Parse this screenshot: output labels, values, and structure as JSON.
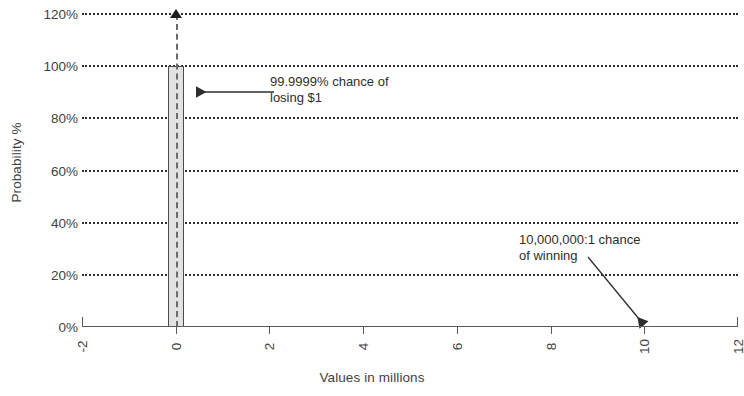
{
  "chart_data": {
    "type": "bar",
    "title": "",
    "subtitle": "",
    "xlabel": "Values in millions",
    "ylabel": "Probability %",
    "xlim": [
      -2,
      12
    ],
    "ylim": [
      0,
      120
    ],
    "grid": true,
    "legend": false,
    "x_ticks": [
      "-2",
      "0",
      "2",
      "4",
      "6",
      "8",
      "10",
      "12"
    ],
    "x_tick_values": [
      -2,
      0,
      2,
      4,
      6,
      8,
      10,
      12
    ],
    "y_ticks": [
      "0%",
      "20%",
      "40%",
      "60%",
      "80%",
      "100%",
      "120%"
    ],
    "y_tick_values": [
      0,
      20,
      40,
      60,
      80,
      100,
      120
    ],
    "categories": [
      0,
      10
    ],
    "values": [
      100,
      1e-05
    ],
    "series": [
      {
        "name": "Probability",
        "x": [
          0,
          10
        ],
        "values": [
          100,
          1e-05
        ]
      }
    ],
    "annotations": [
      {
        "text": "99.9999% chance of\nlosing $1",
        "points_to_x": 0,
        "points_to_y": 90,
        "arrow": "left"
      },
      {
        "text": "10,000,000:1 chance\nof winning",
        "points_to_x": 10,
        "points_to_y": 0,
        "arrow": "down-right"
      }
    ],
    "markers": [
      {
        "name": "peak-marker",
        "x": 0,
        "y": 120,
        "shape": "triangle-up"
      }
    ]
  },
  "colors": {
    "bar_fill": "#e2e2e2",
    "bar_stroke": "#4a4a4a",
    "gridline": "#2d2d2d",
    "axis": "#5a5a5a",
    "text": "#3f3f3f",
    "annotation_text": "#2e2e2e",
    "marker": "#1d1d1d",
    "background": "#ffffff"
  }
}
